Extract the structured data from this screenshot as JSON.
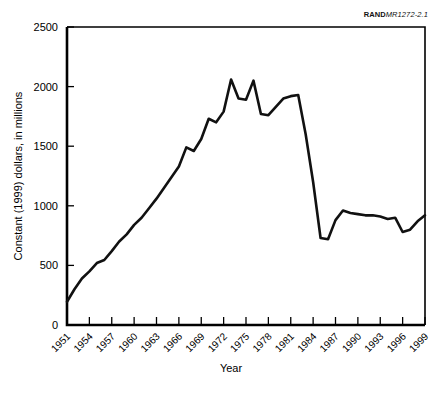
{
  "figure": {
    "source_note_bold": "RAND",
    "source_note_italic": "MR1272-2.1"
  },
  "chart_data": {
    "type": "line",
    "title": "",
    "xlabel": "Year",
    "ylabel": "Constant (1999) dollars, in millions",
    "xlim": [
      1951,
      1999
    ],
    "ylim": [
      0,
      2500
    ],
    "grid": false,
    "legend": "none",
    "ytick_labels": [
      "0",
      "500",
      "1000",
      "1500",
      "2000",
      "2500"
    ],
    "ytick_values": [
      0,
      500,
      1000,
      1500,
      2000,
      2500
    ],
    "xtick_labels": [
      "1951",
      "1954",
      "1957",
      "1960",
      "1963",
      "1966",
      "1969",
      "1972",
      "1975",
      "1978",
      "1981",
      "1984",
      "1987",
      "1990",
      "1993",
      "1996",
      "1999"
    ],
    "xtick_values": [
      1951,
      1954,
      1957,
      1960,
      1963,
      1966,
      1969,
      1972,
      1975,
      1978,
      1981,
      1984,
      1987,
      1990,
      1993,
      1996,
      1999
    ],
    "x": [
      1951,
      1952,
      1953,
      1954,
      1955,
      1956,
      1957,
      1958,
      1959,
      1960,
      1961,
      1962,
      1963,
      1964,
      1965,
      1966,
      1967,
      1968,
      1969,
      1970,
      1971,
      1972,
      1973,
      1974,
      1975,
      1976,
      1977,
      1978,
      1979,
      1980,
      1981,
      1982,
      1983,
      1984,
      1985,
      1986,
      1987,
      1988,
      1989,
      1990,
      1991,
      1992,
      1993,
      1994,
      1995,
      1996,
      1997,
      1998,
      1999
    ],
    "values": [
      195,
      300,
      390,
      450,
      520,
      545,
      620,
      700,
      760,
      840,
      900,
      980,
      1060,
      1150,
      1240,
      1330,
      1490,
      1460,
      1560,
      1730,
      1700,
      1790,
      2060,
      1900,
      1890,
      2050,
      1770,
      1760,
      1830,
      1900,
      1920,
      1930,
      1600,
      1200,
      730,
      720,
      880,
      960,
      940,
      930,
      920,
      920,
      910,
      890,
      900,
      780,
      800,
      870,
      920
    ],
    "series": [
      {
        "name": "Constant (1999) dollars, in millions",
        "values": [
          195,
          300,
          390,
          450,
          520,
          545,
          620,
          700,
          760,
          840,
          900,
          980,
          1060,
          1150,
          1240,
          1330,
          1490,
          1460,
          1560,
          1730,
          1700,
          1790,
          2060,
          1900,
          1890,
          2050,
          1770,
          1760,
          1830,
          1900,
          1920,
          1930,
          1600,
          1200,
          730,
          720,
          880,
          960,
          940,
          930,
          920,
          920,
          910,
          890,
          900,
          780,
          800,
          870,
          920
        ]
      }
    ]
  }
}
